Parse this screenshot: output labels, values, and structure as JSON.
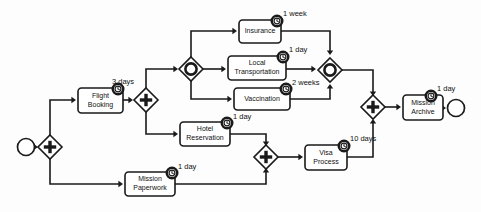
{
  "diagram": {
    "type": "bpmn-process-diagram",
    "width": 481,
    "height": 212,
    "background_color": "#fdfdfd",
    "stroke_color": "#1a1a1a",
    "fill_color": "#ffffff"
  },
  "events": [
    {
      "id": "start",
      "name": "start-event",
      "kind": "start",
      "cx": 26,
      "cy": 147,
      "r": 8.5
    },
    {
      "id": "end",
      "name": "end-event",
      "kind": "end",
      "cx": 456,
      "cy": 108,
      "r": 8.5
    }
  ],
  "gateways": [
    {
      "id": "gw-split-main",
      "name": "parallel-gateway-split-main",
      "kind": "parallel",
      "cx": 50,
      "cy": 147,
      "r": 12
    },
    {
      "id": "gw-split-flight",
      "name": "parallel-gateway-split-flight",
      "kind": "parallel",
      "cx": 146,
      "cy": 100,
      "r": 12
    },
    {
      "id": "gw-incl-split",
      "name": "inclusive-gateway-split",
      "kind": "inclusive",
      "cx": 191,
      "cy": 69,
      "r": 12
    },
    {
      "id": "gw-incl-join",
      "name": "inclusive-gateway-join",
      "kind": "inclusive",
      "cx": 330,
      "cy": 70,
      "r": 12
    },
    {
      "id": "gw-join-visa",
      "name": "parallel-gateway-join-visa",
      "kind": "parallel",
      "cx": 266,
      "cy": 157,
      "r": 12
    },
    {
      "id": "gw-join-final",
      "name": "parallel-gateway-join-final",
      "kind": "parallel",
      "cx": 373,
      "cy": 107,
      "r": 12
    }
  ],
  "tasks": [
    {
      "id": "t-flight",
      "name": "task-flight-booking",
      "label_line1": "Flight",
      "label_line2": "Booking",
      "x": 78,
      "y": 88,
      "w": 45,
      "h": 25,
      "duration": "3 days",
      "duration_x": 112,
      "duration_y": 82
    },
    {
      "id": "t-insurance",
      "name": "task-insurance",
      "label_line1": "Insurance",
      "label_line2": "",
      "x": 239,
      "y": 20,
      "w": 42,
      "h": 23,
      "duration": "1 week",
      "duration_x": 283,
      "duration_y": 14
    },
    {
      "id": "t-local",
      "name": "task-local-transportation",
      "label_line1": "Local",
      "label_line2": "Transportation",
      "x": 228,
      "y": 56,
      "w": 58,
      "h": 24,
      "duration": "1 day",
      "duration_x": 289,
      "duration_y": 50
    },
    {
      "id": "t-vaccination",
      "name": "task-vaccination",
      "label_line1": "Vaccination",
      "label_line2": "",
      "x": 234,
      "y": 88,
      "w": 56,
      "h": 22,
      "duration": "2 weeks",
      "duration_x": 292,
      "duration_y": 83
    },
    {
      "id": "t-hotel",
      "name": "task-hotel-reservation",
      "label_line1": "Hotel",
      "label_line2": "Reservation",
      "x": 180,
      "y": 122,
      "w": 50,
      "h": 24,
      "duration": "1 day",
      "duration_x": 233,
      "duration_y": 117
    },
    {
      "id": "t-paperwork",
      "name": "task-mission-paperwork",
      "label_line1": "Mission",
      "label_line2": "Paperwork",
      "x": 125,
      "y": 172,
      "w": 50,
      "h": 24,
      "duration": "1 day",
      "duration_x": 178,
      "duration_y": 167
    },
    {
      "id": "t-visa",
      "name": "task-visa-process",
      "label_line1": "Visa",
      "label_line2": "Process",
      "x": 305,
      "y": 145,
      "w": 42,
      "h": 25,
      "duration": "10 days",
      "duration_x": 350,
      "duration_y": 139
    },
    {
      "id": "t-archive",
      "name": "task-mission-archive",
      "label_line1": "Mission",
      "label_line2": "Archive",
      "x": 403,
      "y": 95,
      "w": 40,
      "h": 25,
      "duration": "1 day",
      "duration_x": 437,
      "duration_y": 89
    }
  ],
  "timer_markers": [
    {
      "name": "timer-flight-booking",
      "cx": 118,
      "cy": 89,
      "r": 5.2
    },
    {
      "name": "timer-insurance",
      "cx": 277,
      "cy": 21,
      "r": 5.2
    },
    {
      "name": "timer-local-transportation",
      "cx": 283,
      "cy": 57,
      "r": 5.2
    },
    {
      "name": "timer-vaccination",
      "cx": 286,
      "cy": 89,
      "r": 5.2
    },
    {
      "name": "timer-hotel-reservation",
      "cx": 227,
      "cy": 123,
      "r": 5.2
    },
    {
      "name": "timer-mission-paperwork",
      "cx": 172,
      "cy": 173,
      "r": 5.2
    },
    {
      "name": "timer-visa-process",
      "cx": 344,
      "cy": 146,
      "r": 5.2
    },
    {
      "name": "timer-mission-archive",
      "cx": 431,
      "cy": 96,
      "r": 5.2
    }
  ],
  "flows": [
    {
      "name": "flow-start-to-split",
      "d": "M 35,147 L 36,147",
      "arrow": true,
      "ax": 38,
      "ay": 147,
      "adir": "right"
    },
    {
      "name": "flow-split-to-flight",
      "d": "M 50,135 L 50,100 L 74,100",
      "arrow": true,
      "ax": 76,
      "ay": 100,
      "adir": "right"
    },
    {
      "name": "flow-split-to-paperwork",
      "d": "M 50,159 L 50,184 L 121,184",
      "arrow": true,
      "ax": 123,
      "ay": 184,
      "adir": "right"
    },
    {
      "name": "flow-flight-to-gateway",
      "d": "M 123,100 L 130,100",
      "arrow": true,
      "ax": 133,
      "ay": 100,
      "adir": "right"
    },
    {
      "name": "flow-gateway-to-incl",
      "d": "M 146,88 L 146,69 L 175,69",
      "arrow": true,
      "ax": 178,
      "ay": 69,
      "adir": "right"
    },
    {
      "name": "flow-gateway-to-hotel",
      "d": "M 146,112 L 146,134 L 176,134",
      "arrow": true,
      "ax": 178,
      "ay": 134,
      "adir": "right"
    },
    {
      "name": "flow-incl-to-insurance",
      "d": "M 191,57 L 191,31 L 235,31",
      "arrow": true,
      "ax": 237,
      "ay": 31,
      "adir": "right"
    },
    {
      "name": "flow-incl-to-local",
      "d": "M 203,69 L 224,69",
      "arrow": true,
      "ax": 226,
      "ay": 69,
      "adir": "right"
    },
    {
      "name": "flow-incl-to-vaccination",
      "d": "M 191,81 L 191,99 L 230,99",
      "arrow": true,
      "ax": 232,
      "ay": 99,
      "adir": "right"
    },
    {
      "name": "flow-insurance-to-join",
      "d": "M 281,31 L 330,31 L 330,52",
      "arrow": true,
      "ax": 330,
      "ay": 55,
      "adir": "down"
    },
    {
      "name": "flow-local-to-join",
      "d": "M 286,69 L 314,69",
      "arrow": true,
      "ax": 316,
      "ay": 69,
      "adir": "right"
    },
    {
      "name": "flow-vaccination-to-join",
      "d": "M 290,99 L 330,99 L 330,87",
      "arrow": true,
      "ax": 330,
      "ay": 84,
      "adir": "up"
    },
    {
      "name": "flow-incljoin-to-final",
      "d": "M 342,70 L 373,70 L 373,93",
      "arrow": true,
      "ax": 373,
      "ay": 96,
      "adir": "down"
    },
    {
      "name": "flow-hotel-to-visajoin",
      "d": "M 230,134 L 266,134 L 266,143",
      "arrow": true,
      "ax": 266,
      "ay": 146,
      "adir": "down"
    },
    {
      "name": "flow-paperwork-to-visajoin",
      "d": "M 175,184 L 266,184 L 266,171",
      "arrow": true,
      "ax": 266,
      "ay": 168,
      "adir": "up"
    },
    {
      "name": "flow-visajoin-to-visa",
      "d": "M 278,157 L 300,157",
      "arrow": true,
      "ax": 303,
      "ay": 157,
      "adir": "right"
    },
    {
      "name": "flow-visa-to-final",
      "d": "M 347,157 L 373,157 L 373,122",
      "arrow": true,
      "ax": 373,
      "ay": 119,
      "adir": "up"
    },
    {
      "name": "flow-final-to-archive",
      "d": "M 385,107 L 399,107",
      "arrow": true,
      "ax": 401,
      "ay": 107,
      "adir": "right"
    },
    {
      "name": "flow-archive-to-end",
      "d": "M 443,108 L 444,108",
      "arrow": true,
      "ax": 446,
      "ay": 108,
      "adir": "right"
    }
  ]
}
